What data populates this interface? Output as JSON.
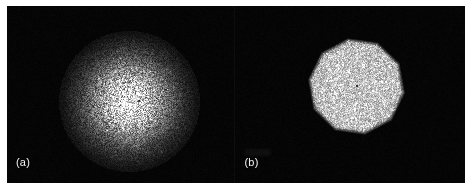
{
  "figure": {
    "type": "two-panel-image-figure",
    "width": 471,
    "height": 189,
    "background_color": "#ffffff",
    "panel_background_color": "#000000",
    "label_color": "#f2f2f2"
  },
  "panels": [
    {
      "id": "panel-a",
      "label": "(a)",
      "description": "diffuse gaussian speckle cloud",
      "shape": "gaussian-disc",
      "center": {
        "x": 122,
        "y": 95
      },
      "radius": 63,
      "edge_softness": "soft",
      "peak_gray": "#d8d8d8",
      "center_dot": {
        "x": 132,
        "y": 95
      }
    },
    {
      "id": "panel-b",
      "label": "(b)",
      "description": "sharp faceted polygonal speckle disc",
      "shape": "polygon",
      "polygon_sides": 10,
      "polygon_rotation_deg": 8,
      "center": {
        "x": 121,
        "y": 80
      },
      "radius": 48,
      "edge_softness": "sharp",
      "peak_gray": "#b6b6b6",
      "center_dot": {
        "x": 122,
        "y": 80
      }
    }
  ],
  "chart_data": {
    "type": "heatmap",
    "title": "",
    "xlabel": "",
    "ylabel": "",
    "legend": [],
    "annotations": [
      "(a)",
      "(b)"
    ],
    "series": [
      {
        "name": "(a)",
        "profile": "gaussian",
        "peak_intensity": 0.85,
        "sigma_px": 30,
        "outer_radius_px": 63,
        "speckle_contrast": 0.45,
        "background_intensity": 0.01
      },
      {
        "name": "(b)",
        "profile": "flat-top-polygon",
        "peak_intensity": 0.72,
        "sides": 10,
        "outer_radius_px": 48,
        "speckle_contrast": 0.22,
        "background_intensity": 0.01
      }
    ]
  }
}
